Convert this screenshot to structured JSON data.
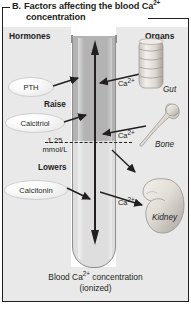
{
  "figure": {
    "label": "B.",
    "title_line1": "Factors affecting the blood Ca",
    "title_sup": "2+",
    "title_line2": "concentration"
  },
  "columns": {
    "left_header": "Hormones",
    "right_header": "Organs"
  },
  "hormones": [
    {
      "name": "PTH",
      "effect": "raise"
    },
    {
      "name": "Calcitriol",
      "effect": "raise"
    },
    {
      "name": "Calcitonin",
      "effect": "lower"
    }
  ],
  "effect_labels": {
    "raise": "Raise",
    "lowers": "Lowers"
  },
  "reference": {
    "value": "1.25",
    "unit": "mmol/L"
  },
  "organs": [
    {
      "name": "Gut",
      "ion_label": "Ca",
      "ion_sup": "2+"
    },
    {
      "name": "Bone",
      "ion_label": "Ca",
      "ion_sup": "2+"
    },
    {
      "name": "Kidney",
      "ion_label": "Ca",
      "ion_sup": "2+"
    }
  ],
  "caption": {
    "line1_pre": "Blood Ca",
    "line1_sup": "2+",
    "line1_post": " concentration",
    "line2": "(ionized)"
  },
  "colors": {
    "ink": "#231f20",
    "panel": "#e9e9e9",
    "tube_upper": "#b3b3b3",
    "tube_lower": "#dedede",
    "tube_outline": "#8e8e8e"
  }
}
